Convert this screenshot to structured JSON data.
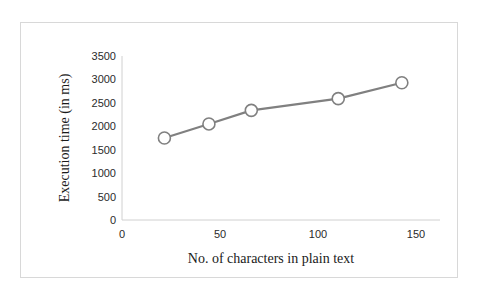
{
  "chart_data": {
    "type": "line",
    "title": "",
    "subtitle": "",
    "xlabel": "No. of characters in plain text",
    "ylabel": "Execution time (in ms)",
    "xlim": [
      0,
      150
    ],
    "ylim": [
      0,
      3500
    ],
    "xticks": [
      0,
      50,
      100,
      150
    ],
    "xtick_labels": [
      "0",
      "50",
      "100",
      "150"
    ],
    "yticks": [
      0,
      500,
      1000,
      1500,
      2000,
      2500,
      3000,
      3500
    ],
    "ytick_labels": [
      "0",
      "500",
      "1000",
      "1500",
      "2000",
      "2500",
      "3000",
      "3500"
    ],
    "grid": false,
    "legend": "none",
    "series": [
      {
        "name": "Execution time",
        "line_color": "#808080",
        "marker": "open-circle",
        "marker_face_color": "#ffffff",
        "marker_edge_color": "#808080",
        "x": [
          20,
          41,
          61,
          102,
          132
        ],
        "values": [
          1750,
          2050,
          2340,
          2590,
          2930
        ]
      }
    ]
  },
  "figure": {
    "border_color": "#d8d8d8",
    "background_color": "#ffffff",
    "axis_color": "#d0d0d0",
    "text_color": "#1a1a1a"
  }
}
